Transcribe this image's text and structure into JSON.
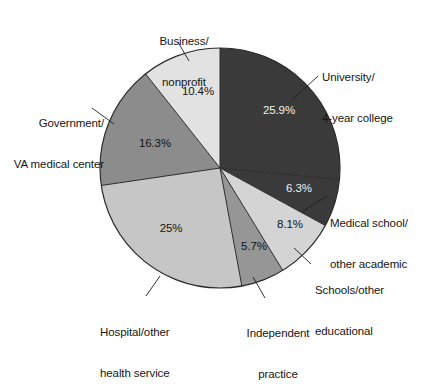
{
  "chart_data": {
    "type": "pie",
    "title": "",
    "subtitle": "",
    "xlabel": "",
    "ylabel": "",
    "legend_position": "callout-labels",
    "grid": false,
    "start_angle_deg": 0,
    "direction": "clockwise",
    "categories": [
      "University/\n4-year college",
      "Medical school/\nother academic",
      "Schools/other\neducational",
      "Independent\npractice",
      "Hospital/other\nhealth service",
      "Government/\nVA medical center",
      "Business/\nnonprofit"
    ],
    "values": [
      25.9,
      6.3,
      8.1,
      5.7,
      25.0,
      16.3,
      10.4
    ],
    "value_labels": [
      "25.9%",
      "6.3%",
      "8.1%",
      "5.7%",
      "25%",
      "16.3%",
      "10.4%"
    ],
    "slice_colors": [
      "#3a3a3a",
      "#3a3a3a",
      "#d4d4d4",
      "#969696",
      "#c6c6c6",
      "#8c8c8c",
      "#e2e2e2"
    ],
    "outline_color": "#2b2b2b",
    "background": "#ffffff"
  },
  "pie": {
    "center_x": 220,
    "center_y": 168,
    "radius": 120,
    "slices": [
      {
        "id": "university-4-year-college",
        "name": "University/ 4-year college",
        "pct_label": "25.9%",
        "value": 25.9,
        "color": "#3a3a3a",
        "pct_x": 279,
        "pct_y": 114,
        "pct_class": "pct-dark"
      },
      {
        "id": "medical-school-other-academic",
        "name": "Medical school/ other academic",
        "pct_label": "6.3%",
        "value": 6.3,
        "color": "#3a3a3a",
        "pct_x": 299,
        "pct_y": 192,
        "pct_class": "pct-dark"
      },
      {
        "id": "schools-other-educational",
        "name": "Schools/other educational",
        "pct_label": "8.1%",
        "value": 8.1,
        "color": "#d4d4d4",
        "pct_x": 290,
        "pct_y": 228,
        "pct_class": "pct-light"
      },
      {
        "id": "independent-practice",
        "name": "Independent practice",
        "pct_label": "5.7%",
        "value": 5.7,
        "color": "#969696",
        "pct_x": 254,
        "pct_y": 250,
        "pct_class": "pct-light"
      },
      {
        "id": "hospital-other-health-service",
        "name": "Hospital/other health service",
        "pct_label": "25%",
        "value": 25.0,
        "color": "#c6c6c6",
        "pct_x": 171,
        "pct_y": 232,
        "pct_class": "pct-light"
      },
      {
        "id": "government-va-medical-center",
        "name": "Government/ VA medical center",
        "pct_label": "16.3%",
        "value": 16.3,
        "color": "#8c8c8c",
        "pct_x": 155,
        "pct_y": 147,
        "pct_class": "pct-light"
      },
      {
        "id": "business-nonprofit",
        "name": "Business/ nonprofit",
        "pct_label": "10.4%",
        "value": 10.4,
        "color": "#e2e2e2",
        "pct_x": 198,
        "pct_y": 95,
        "pct_class": "pct-light"
      }
    ]
  },
  "labels": {
    "university": {
      "line1": "University/",
      "line2": "4-year college"
    },
    "medical_school": {
      "line1": "Medical school/",
      "line2": "other academic"
    },
    "schools_other": {
      "line1": "Schools/other",
      "line2": "educational"
    },
    "independent": {
      "line1": "Independent",
      "line2": "practice"
    },
    "hospital": {
      "line1": "Hospital/other",
      "line2": "health service"
    },
    "government": {
      "line1": "Government/",
      "line2": "VA medical center"
    },
    "business": {
      "line1": "Business/",
      "line2": "nonprofit"
    }
  }
}
